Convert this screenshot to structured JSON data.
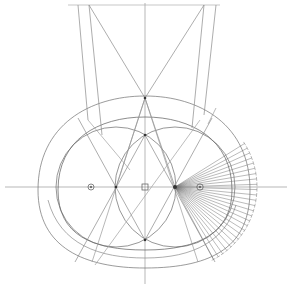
{
  "figure": {
    "width": 287,
    "height": 284,
    "background": "#ffffff",
    "stroke_color": "#6f6f6f",
    "dark_stroke": "#3a3a3a"
  },
  "axes": {
    "horizontal": {
      "x1": 5,
      "y1": 187,
      "x2": 287,
      "y2": 187
    },
    "vertical": {
      "x1": 145,
      "y1": 3,
      "x2": 145,
      "y2": 284
    },
    "top_line": {
      "x1": 68,
      "y1": 5,
      "x2": 220,
      "y2": 5
    }
  },
  "markers": [
    {
      "name": "left-center-marker",
      "shape": "circle",
      "x": 91,
      "y": 187
    },
    {
      "name": "middle-center-marker",
      "shape": "square",
      "x": 145,
      "y": 187
    },
    {
      "name": "right-center-marker",
      "shape": "circle",
      "x": 200,
      "y": 187
    }
  ],
  "key_points": {
    "apex": {
      "x": 145,
      "y": 98
    },
    "top_left": {
      "x": 89,
      "y": 5
    },
    "top_right": {
      "x": 204,
      "y": 5
    },
    "vesica_top": {
      "x": 145,
      "y": 135
    },
    "vesica_bottom": {
      "x": 145,
      "y": 240
    },
    "left_node": {
      "x": 116,
      "y": 187
    },
    "right_node": {
      "x": 175,
      "y": 187
    }
  },
  "radial_fan": {
    "origin": {
      "x": 175,
      "y": 187
    },
    "count": 26,
    "radius": 82,
    "start_angle_deg": -32,
    "end_angle_deg": 62
  }
}
